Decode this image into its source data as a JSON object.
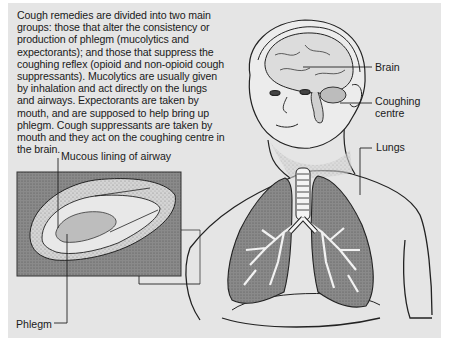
{
  "intro_text": "Cough remedies are divided into two main groups: those that alter the consistency or production of phlegm (mucolytics and expectorants); and those that suppress the coughing reflex (opioid and non-opioid cough suppressants). Mucolytics are usually given by inhalation and act directly on the lungs and airways. Expectorants are taken by mouth, and are supposed to help bring up phlegm. Cough suppressants are taken by mouth and they act on the coughing centre in the brain.",
  "labels": {
    "brain": "Brain",
    "coughing_centre_line1": "Coughing",
    "coughing_centre_line2": "centre",
    "lungs": "Lungs",
    "mucous_lining": "Mucous lining of airway",
    "phlegm": "Phlegm"
  },
  "colors": {
    "panel_bg": "#e5e5e5",
    "inset_bg": "#8e8e8e",
    "lung_fill": "#7a7a7a",
    "line": "#222222"
  }
}
